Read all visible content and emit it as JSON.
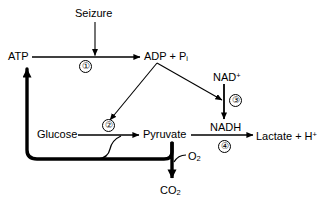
{
  "diagram": {
    "type": "flow-diagram",
    "background_color": "#ffffff",
    "stroke_color": "#000000",
    "nodes": [
      {
        "id": "seizure",
        "label": "Seizure",
        "x": 75,
        "y": 8,
        "kind": "stimulus"
      },
      {
        "id": "atp",
        "label": "ATP",
        "x": 8,
        "y": 51,
        "kind": "metabolite"
      },
      {
        "id": "adp_pi",
        "label": "ADP + P",
        "sub": "i",
        "x": 144,
        "y": 51,
        "kind": "metabolite"
      },
      {
        "id": "nad_plus",
        "label": "NAD",
        "sup": "+",
        "x": 213,
        "y": 72,
        "kind": "cofactor"
      },
      {
        "id": "glucose",
        "label": "Glucose",
        "x": 37,
        "y": 129,
        "kind": "metabolite"
      },
      {
        "id": "pyruvate",
        "label": "Pyruvate",
        "x": 143,
        "y": 129,
        "kind": "metabolite"
      },
      {
        "id": "nadh",
        "label": "NADH",
        "x": 210,
        "y": 122,
        "kind": "cofactor"
      },
      {
        "id": "lactate",
        "label": "Lactate + H",
        "sup": "+",
        "x": 256,
        "y": 131,
        "kind": "metabolite"
      },
      {
        "id": "o2",
        "label": "O",
        "sub": "2",
        "x": 188,
        "y": 151,
        "kind": "metabolite"
      },
      {
        "id": "co2",
        "label": "CO",
        "sub": "2",
        "x": 160,
        "y": 185,
        "kind": "metabolite"
      }
    ],
    "steps": [
      {
        "id": "step1",
        "number": "①",
        "x": 79,
        "y": 64,
        "reaction": "ATP → ADP + Pi"
      },
      {
        "id": "step2",
        "number": "②",
        "x": 100,
        "y": 124,
        "reaction": "Glucose → Pyruvate"
      },
      {
        "id": "step3",
        "number": "③",
        "x": 228,
        "y": 95,
        "reaction": "NAD+ → NADH"
      },
      {
        "id": "step4",
        "number": "④",
        "x": 222,
        "y": 142,
        "reaction": "Pyruvate → Lactate + H+"
      }
    ],
    "edges": [
      {
        "id": "seizure-to-step1",
        "from": "seizure",
        "to": "step1",
        "style": "thin-vertical"
      },
      {
        "id": "atp-to-adp",
        "from": "atp",
        "to": "adp_pi",
        "style": "thin-horizontal"
      },
      {
        "id": "adp-to-step2",
        "from": "adp_pi",
        "to": "step2",
        "style": "thin-diagonal"
      },
      {
        "id": "adp-to-step3",
        "from": "adp_pi",
        "to": "step3",
        "style": "thin-diagonal"
      },
      {
        "id": "nad-to-nadh",
        "from": "nad_plus",
        "to": "nadh",
        "style": "thin-vertical"
      },
      {
        "id": "glucose-to-pyruvate",
        "from": "glucose",
        "to": "pyruvate",
        "style": "thin-horizontal"
      },
      {
        "id": "pyruvate-to-lactate",
        "from": "pyruvate",
        "to": "lactate",
        "style": "thin-horizontal"
      },
      {
        "id": "pyruvate-to-co2",
        "from": "pyruvate",
        "to": "co2",
        "style": "thick-vertical"
      },
      {
        "id": "o2-into-co2-arrow",
        "from": "o2",
        "to": "co2",
        "style": "thin-curve"
      },
      {
        "id": "recycle-to-atp",
        "from": "pyruvate",
        "to": "atp",
        "style": "thick-elbow"
      },
      {
        "id": "branch-to-glycolysis",
        "from": "recycle",
        "to": "glucose-to-pyruvate",
        "style": "thin-s-curve"
      }
    ]
  }
}
